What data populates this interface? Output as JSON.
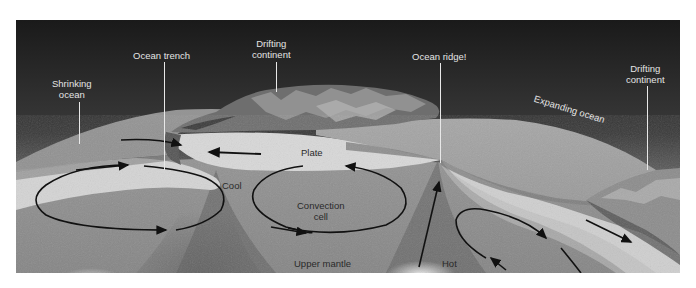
{
  "diagram": {
    "colors": {
      "sky_top": "#1c1c1c",
      "sky_glow": "#b9b9b9",
      "ocean": "#a8a8a8",
      "plate": "#d6d6d6",
      "mantle": "#8e8e8e",
      "arrow": "#111111"
    },
    "labels": {
      "shrinking_ocean": "Shrinking\nocean",
      "ocean_trench": "Ocean trench",
      "drifting_continent_left": "Drifting\ncontinent",
      "ocean_ridge": "Ocean ridge!",
      "drifting_continent_right": "Drifting\ncontinent",
      "expanding_ocean": "Expanding ocean",
      "plate": "Plate",
      "cool": "Cool",
      "convection_cell": "Convection\ncell",
      "upper_mantle": "Upper mantle",
      "hot": "Hot"
    }
  }
}
